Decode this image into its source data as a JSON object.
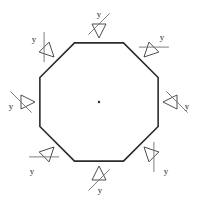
{
  "figure": {
    "shape": {
      "name": "regular-octagon",
      "sides": 8,
      "center": [
        99,
        102
      ],
      "circumradius": 64,
      "rotation_deg": 22.5,
      "stroke_color": "#2b2b2b",
      "stroke_width": 1.6,
      "fill_color": "#ffffff"
    },
    "spokes": {
      "name": "center-to-vertex-lines",
      "count": 8,
      "stroke_color": "#8c8c8c",
      "stroke_width": 0.8
    },
    "center_dot": {
      "radius": 1.2,
      "color": "#2b2b2b"
    },
    "supports": [
      {
        "id": "support-top",
        "label": "y",
        "edge": "top",
        "anchor": [
          99,
          38
        ],
        "normal_deg": 270,
        "label_pos": [
          99,
          15
        ],
        "hatch_angle_deg": 315
      },
      {
        "id": "support-top-right",
        "label": "y",
        "edge": "top-right",
        "anchor": [
          144,
          57
        ],
        "normal_deg": 315,
        "label_pos": [
          162,
          38
        ],
        "hatch_angle_deg": 0
      },
      {
        "id": "support-right",
        "label": "y",
        "edge": "right",
        "anchor": [
          163,
          102
        ],
        "normal_deg": 0,
        "label_pos": [
          187,
          107
        ],
        "hatch_angle_deg": 45
      },
      {
        "id": "support-bottom-right",
        "label": "y",
        "edge": "bottom-right",
        "anchor": [
          144,
          147
        ],
        "normal_deg": 45,
        "label_pos": [
          166,
          172
        ],
        "hatch_angle_deg": 90
      },
      {
        "id": "support-bottom",
        "label": "y",
        "edge": "bottom",
        "anchor": [
          99,
          166
        ],
        "normal_deg": 90,
        "label_pos": [
          100,
          191
        ],
        "hatch_angle_deg": 135
      },
      {
        "id": "support-bottom-left",
        "label": "y",
        "edge": "bottom-left",
        "anchor": [
          54,
          147
        ],
        "normal_deg": 135,
        "label_pos": [
          32,
          172
        ],
        "hatch_angle_deg": 180
      },
      {
        "id": "support-left",
        "label": "y",
        "edge": "left",
        "anchor": [
          35,
          102
        ],
        "normal_deg": 180,
        "label_pos": [
          11,
          107
        ],
        "hatch_angle_deg": 225
      },
      {
        "id": "support-top-left",
        "label": "y",
        "edge": "top-left",
        "anchor": [
          54,
          57
        ],
        "normal_deg": 225,
        "label_pos": [
          34,
          40
        ],
        "hatch_angle_deg": 270
      }
    ],
    "support_style": {
      "triangle_length": 14,
      "triangle_half_width": 7,
      "triangle_stroke": "#3a3a3a",
      "triangle_stroke_width": 0.9,
      "hatch_line_length": 30,
      "hatch_stroke": "#6e6e6e",
      "hatch_stroke_width": 0.9
    }
  }
}
